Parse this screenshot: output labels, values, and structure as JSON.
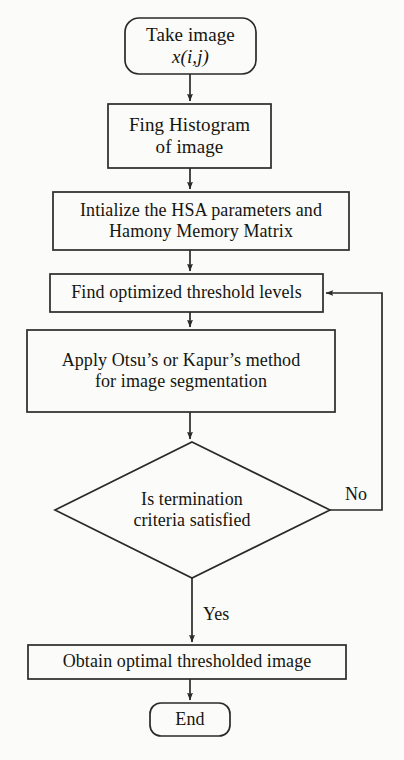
{
  "figure": {
    "kind": "flowchart"
  },
  "nodes": {
    "start": {
      "shape": "rounded-rectangle",
      "line1": "Take image",
      "line2": "x(i,j)"
    },
    "histogram": {
      "shape": "rectangle",
      "line1": "Fing Histogram",
      "line2": "of image"
    },
    "initialize": {
      "shape": "rectangle",
      "line1": "Intialize the HSA parameters and",
      "line2": "Hamony Memory Matrix"
    },
    "find_threshold": {
      "shape": "rectangle",
      "line1": "Find optimized threshold levels"
    },
    "apply_method": {
      "shape": "rectangle",
      "line1": "Apply Otsu’s or Kapur’s method",
      "line2": "for image segmentation"
    },
    "decision": {
      "shape": "diamond",
      "line1": "Is termination",
      "line2": "criteria satisfied"
    },
    "obtain": {
      "shape": "rectangle",
      "line1": "Obtain optimal thresholded image"
    },
    "end": {
      "shape": "rounded-rectangle",
      "line1": "End"
    }
  },
  "edge_labels": {
    "no": "No",
    "yes": "Yes"
  },
  "colors": {
    "background": "#fbfbf9",
    "stroke": "#2a2a2a",
    "text": "#15150f"
  }
}
